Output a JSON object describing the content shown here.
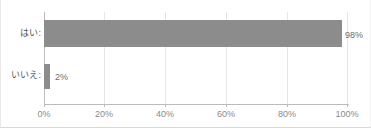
{
  "chart_data": {
    "type": "bar",
    "orientation": "horizontal",
    "title": "",
    "xlabel": "",
    "ylabel": "",
    "categories": [
      "はい:",
      "いいえ:"
    ],
    "values": [
      98,
      2
    ],
    "value_labels": [
      "98%",
      "2%"
    ],
    "xlim": [
      0,
      100
    ],
    "xticks": [
      0,
      20,
      40,
      60,
      80,
      100
    ],
    "xtick_labels": [
      "0%",
      "20%",
      "40%",
      "60%",
      "80%",
      "100%"
    ],
    "grid": "vertical",
    "legend": "none",
    "series": [
      {
        "name": "",
        "values": [
          98,
          2
        ],
        "color": "#8c8c8c"
      }
    ]
  },
  "colors": {
    "bar": "#8c8c8c",
    "gridline": "#e6e6e6",
    "axis": "#bbbbbb",
    "tick_text": "#8a8a8a",
    "category_text": "#555555",
    "value_text": "#6e6e6e",
    "background": "#ffffff"
  },
  "title_strip": {
    "text": ""
  }
}
